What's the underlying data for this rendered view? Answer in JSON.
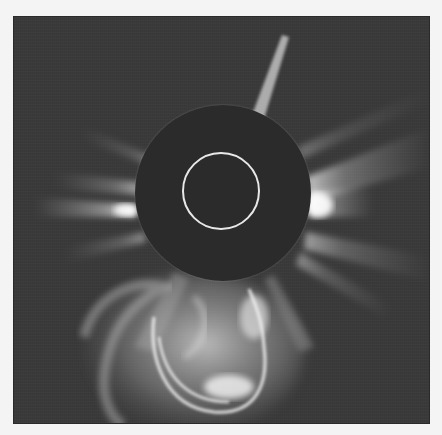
{
  "image": {
    "description": "Coronagraph image of the solar corona showing a coronal mass ejection",
    "subject": "solar-corona-cme",
    "colors": {
      "page_background": "#f4f4f4",
      "sky_background": "#3a3a3a",
      "occulting_disk": "#2b2b2b",
      "solar_limb_circle": "#e8e8e8",
      "streamer_highlight": "#f5f5f5"
    },
    "features": [
      {
        "name": "occulting-disk",
        "label": "Occulting disk"
      },
      {
        "name": "solar-limb-circle",
        "label": "Solar limb outline"
      },
      {
        "name": "coronal-streamers",
        "label": "Coronal streamers"
      },
      {
        "name": "coronal-mass-ejection",
        "label": "Coronal mass ejection (loop)"
      },
      {
        "name": "occulter-pylon",
        "label": "Occulter support pylon"
      }
    ]
  }
}
